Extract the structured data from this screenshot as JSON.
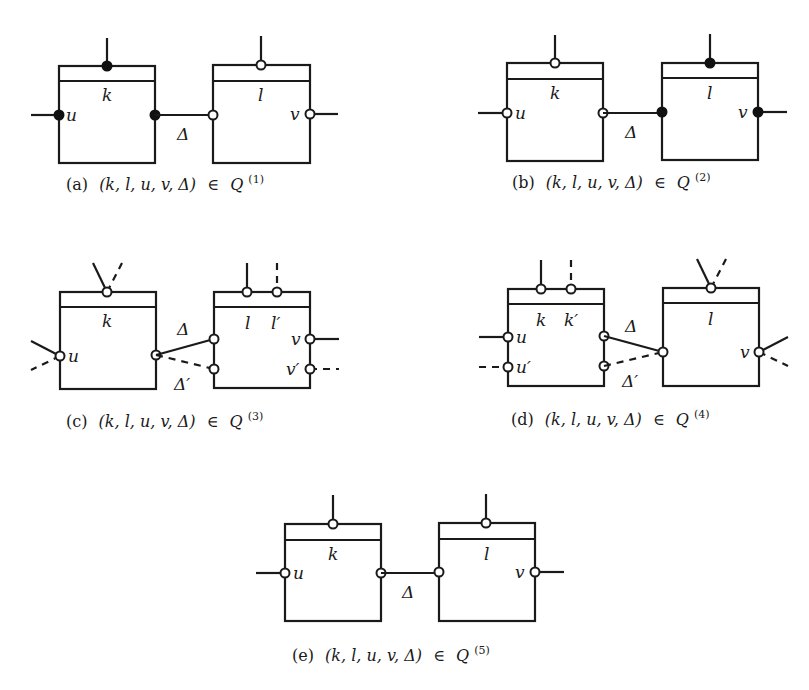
{
  "figure": {
    "panels": [
      {
        "id": "a",
        "caption": {
          "tag": "(a)",
          "tuple": "(k, l, u, v, Δ)",
          "relation": "∈",
          "set": "Q",
          "superscript": "(1)"
        },
        "left_box": {
          "label": "k",
          "port_label": "u",
          "top_port": "filled",
          "left_port": "filled",
          "right_port": "filled"
        },
        "right_box": {
          "label": "l",
          "port_label": "v",
          "top_port": "open",
          "left_port": "open",
          "right_port": "open"
        },
        "edge_label": "Δ"
      },
      {
        "id": "b",
        "caption": {
          "tag": "(b)",
          "tuple": "(k, l, u, v, Δ)",
          "relation": "∈",
          "set": "Q",
          "superscript": "(2)"
        },
        "left_box": {
          "label": "k",
          "port_label": "u",
          "top_port": "open",
          "left_port": "open",
          "right_port": "open"
        },
        "right_box": {
          "label": "l",
          "port_label": "v",
          "top_port": "filled",
          "left_port": "filled",
          "right_port": "filled"
        },
        "edge_label": "Δ"
      },
      {
        "id": "c",
        "caption": {
          "tag": "(c)",
          "tuple": "(k, l, u, v, Δ)",
          "relation": "∈",
          "set": "Q",
          "superscript": "(3)"
        },
        "left_box": {
          "label": "k",
          "port_label": "u"
        },
        "right_box": {
          "labels": [
            "l",
            "l′"
          ],
          "port_labels": [
            "v",
            "v′"
          ]
        },
        "edge_labels": [
          "Δ",
          "Δ′"
        ]
      },
      {
        "id": "d",
        "caption": {
          "tag": "(d)",
          "tuple": "(k, l, u, v, Δ)",
          "relation": "∈",
          "set": "Q",
          "superscript": "(4)"
        },
        "left_box": {
          "labels": [
            "k",
            "k′"
          ],
          "port_labels": [
            "u",
            "u′"
          ]
        },
        "right_box": {
          "label": "l",
          "port_label": "v"
        },
        "edge_labels": [
          "Δ",
          "Δ′"
        ]
      },
      {
        "id": "e",
        "caption": {
          "tag": "(e)",
          "tuple": "(k, l, u, v, Δ)",
          "relation": "∈",
          "set": "Q",
          "superscript": "(5)"
        },
        "left_box": {
          "label": "k",
          "port_label": "u",
          "top_port": "open",
          "left_port": "open",
          "right_port": "open"
        },
        "right_box": {
          "label": "l",
          "port_label": "v",
          "top_port": "open",
          "left_port": "open",
          "right_port": "open"
        },
        "edge_label": "Δ"
      }
    ]
  },
  "colors": {
    "stroke": "#1a1a1a",
    "background": "#ffffff",
    "filled_port": "#111111"
  }
}
